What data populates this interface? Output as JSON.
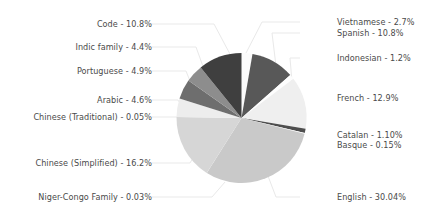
{
  "chart_data": {
    "type": "pie",
    "title": "",
    "subtitle": "",
    "xlabel": "",
    "ylabel": "",
    "legend_position": "none",
    "grid": false,
    "label_format": "{name} - {value}%",
    "start_angle_deg": 90,
    "direction": "clockwise",
    "categories": [
      "Vietnamese",
      "Spanish",
      "Indonesian",
      "French",
      "Catalan",
      "Basque",
      "English",
      "Niger-Congo Family",
      "Chinese (Simplified)",
      "Chinese (Traditional)",
      "Arabic",
      "Portuguese",
      "Indic family",
      "Code"
    ],
    "values": [
      2.7,
      10.8,
      1.2,
      12.9,
      1.1,
      0.15,
      30.04,
      0.03,
      16.2,
      0.05,
      4.6,
      4.9,
      4.4,
      10.8
    ],
    "colors": [
      "#fbfbfb",
      "#585858",
      "#fdfdfd",
      "#efefef",
      "#4e4e4e",
      "#ffffff",
      "#c9c9c9",
      "#f3f3f3",
      "#d6d6d6",
      "#fafafa",
      "#ededed",
      "#6e6e6e",
      "#8d8d8d",
      "#3f3f3f"
    ],
    "slices": [
      {
        "name": "Vietnamese",
        "value": 2.7,
        "label": "Vietnamese - 2.7%",
        "color": "#fbfbfb"
      },
      {
        "name": "Spanish",
        "value": 10.8,
        "label": "Spanish - 10.8%",
        "color": "#585858"
      },
      {
        "name": "Indonesian",
        "value": 1.2,
        "label": "Indonesian - 1.2%",
        "color": "#fdfdfd"
      },
      {
        "name": "French",
        "value": 12.9,
        "label": "French - 12.9%",
        "color": "#efefef"
      },
      {
        "name": "Catalan",
        "value": 1.1,
        "label": "Catalan - 1.10%",
        "color": "#4e4e4e"
      },
      {
        "name": "Basque",
        "value": 0.15,
        "label": "Basque - 0.15%",
        "color": "#ffffff"
      },
      {
        "name": "English",
        "value": 30.04,
        "label": "English - 30.04%",
        "color": "#c9c9c9"
      },
      {
        "name": "Niger-Congo Family",
        "value": 0.03,
        "label": "Niger-Congo Family - 0.03%",
        "color": "#f3f3f3"
      },
      {
        "name": "Chinese (Simplified)",
        "value": 16.2,
        "label": "Chinese (Simplified) - 16.2%",
        "color": "#d6d6d6"
      },
      {
        "name": "Chinese (Traditional)",
        "value": 0.05,
        "label": "Chinese (Traditional) - 0.05%",
        "color": "#fafafa"
      },
      {
        "name": "Arabic",
        "value": 4.6,
        "label": "Arabic - 4.6%",
        "color": "#ededed"
      },
      {
        "name": "Portuguese",
        "value": 4.9,
        "label": "Portuguese - 4.9%",
        "color": "#6e6e6e"
      },
      {
        "name": "Indic family",
        "value": 4.4,
        "label": "Indic family - 4.4%",
        "color": "#8d8d8d"
      },
      {
        "name": "Code",
        "value": 10.8,
        "label": "Code - 10.8%",
        "color": "#3f3f3f"
      }
    ]
  },
  "labels": {
    "vietnamese": "Vietnamese - 2.7%",
    "spanish": "Spanish - 10.8%",
    "indonesian": "Indonesian - 1.2%",
    "french": "French - 12.9%",
    "catalan": "Catalan - 1.10%",
    "basque": "Basque - 0.15%",
    "english": "English - 30.04%",
    "niger_congo": "Niger-Congo Family - 0.03%",
    "chinese_simplified": "Chinese (Simplified) - 16.2%",
    "chinese_traditional": "Chinese (Traditional) - 0.05%",
    "arabic": "Arabic - 4.6%",
    "portuguese": "Portuguese - 4.9%",
    "indic": "Indic family - 4.4%",
    "code": "Code - 10.8%"
  },
  "style": {
    "background": "#ffffff",
    "text_color": "#4a4a4a",
    "leader_color": "#e9e9e9"
  }
}
